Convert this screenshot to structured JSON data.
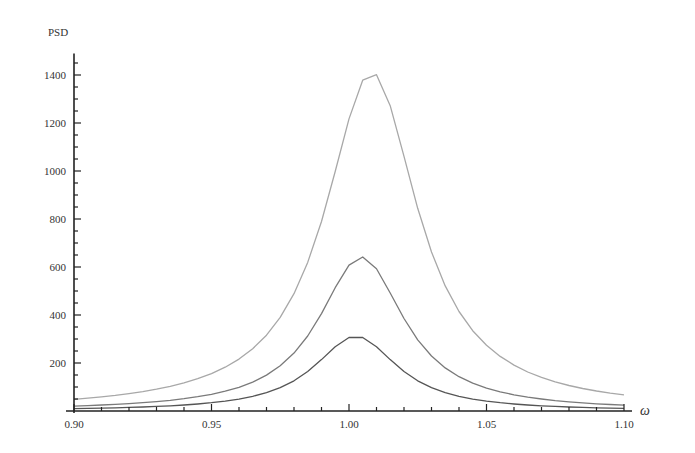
{
  "chart_data": {
    "type": "line",
    "title": "",
    "xlabel": "ω",
    "ylabel": "PSD",
    "xlim": [
      0.9,
      1.1
    ],
    "ylim": [
      0,
      1490
    ],
    "grid": false,
    "legend": null,
    "x_ticks": [
      0.9,
      0.95,
      1.0,
      1.05,
      1.1
    ],
    "x_tick_labels": [
      "0.90",
      "0.95",
      "1.00",
      "1.05",
      "1.10"
    ],
    "x_minor_step": 0.01,
    "y_ticks": [
      200,
      400,
      600,
      800,
      1000,
      1200,
      1400
    ],
    "y_tick_labels": [
      "200",
      "400",
      "600",
      "800",
      "1000",
      "1200",
      "1400"
    ],
    "y_minor_step": 50,
    "x": [
      0.9,
      0.905,
      0.91,
      0.915,
      0.92,
      0.925,
      0.93,
      0.935,
      0.94,
      0.945,
      0.95,
      0.955,
      0.96,
      0.965,
      0.97,
      0.975,
      0.98,
      0.985,
      0.99,
      0.995,
      1.0,
      1.005,
      1.01,
      1.015,
      1.02,
      1.025,
      1.03,
      1.035,
      1.04,
      1.045,
      1.05,
      1.055,
      1.06,
      1.065,
      1.07,
      1.075,
      1.08,
      1.085,
      1.09,
      1.095,
      1.1
    ],
    "series": [
      {
        "name": "high",
        "color": "#a8a8a8",
        "peak": {
          "x": 1.008,
          "y": 1412
        },
        "values": [
          48.9,
          53.6,
          59.0,
          65.2,
          72.4,
          80.8,
          90.8,
          102.7,
          117.0,
          134.5,
          155.8,
          182.6,
          216.2,
          259.6,
          315.9,
          390.1,
          488.6,
          619.3,
          789.7,
          997.9,
          1217.2,
          1378.4,
          1401.2,
          1272.1,
          1060.9,
          844.5,
          662.6,
          521.2,
          414.6,
          334.4,
          273.8,
          227.3,
          191.2,
          162.7,
          140.0,
          121.5,
          106.4,
          93.9,
          83.5,
          74.6,
          67.1
        ]
      },
      {
        "name": "medium",
        "color": "#7a7a7a",
        "peak": {
          "x": 1.004,
          "y": 642
        },
        "values": [
          20.5,
          22.6,
          24.9,
          27.7,
          30.9,
          34.7,
          39.2,
          44.6,
          51.3,
          59.4,
          69.6,
          82.4,
          98.9,
          120.6,
          149.4,
          188.3,
          241.2,
          312.7,
          405.7,
          513.6,
          607.8,
          641.6,
          592.4,
          491.8,
          385.4,
          296.7,
          229.2,
          179.5,
          143.0,
          115.8,
          95.3,
          79.7,
          67.3,
          57.6,
          49.8,
          43.5,
          38.2,
          33.9,
          30.2,
          27.1,
          24.4
        ]
      },
      {
        "name": "low",
        "color": "#555555",
        "peak": {
          "x": 1.002,
          "y": 312
        },
        "values": [
          9.8,
          10.8,
          12.0,
          13.4,
          14.9,
          16.8,
          19.1,
          21.8,
          25.1,
          29.3,
          34.5,
          41.1,
          49.7,
          61.1,
          76.4,
          97.2,
          125.9,
          164.6,
          214.2,
          268.0,
          306.4,
          306.4,
          268.0,
          214.2,
          164.6,
          125.9,
          97.2,
          76.4,
          61.1,
          49.7,
          41.1,
          34.5,
          29.3,
          25.1,
          21.8,
          19.1,
          16.8,
          14.9,
          13.4,
          12.0,
          10.8
        ]
      }
    ]
  },
  "axes": {
    "y_title": "PSD",
    "x_title": "ω",
    "axis_color": "#222222"
  }
}
